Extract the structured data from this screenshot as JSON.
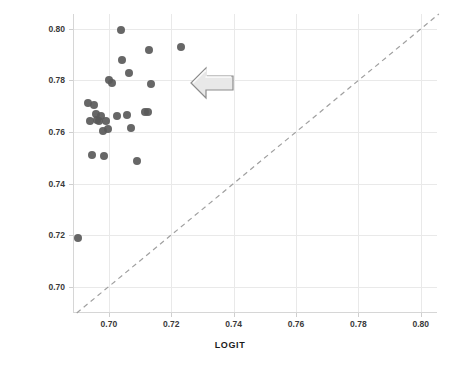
{
  "chart_data": {
    "type": "scatter",
    "title": "",
    "xlabel": "LOGIT",
    "ylabel": "NEURAL NETWORK",
    "xlim": [
      0.6885,
      0.8052
    ],
    "ylim": [
      0.6897,
      0.8058
    ],
    "xticks": [
      "0.70",
      "0.72",
      "0.74",
      "0.76",
      "0.78",
      "0.80"
    ],
    "xtick_values": [
      0.7,
      0.72,
      0.74,
      0.76,
      0.78,
      0.8
    ],
    "yticks": [
      "0.70",
      "0.72",
      "0.74",
      "0.76",
      "0.78",
      "0.80"
    ],
    "ytick_values": [
      0.7,
      0.72,
      0.74,
      0.76,
      0.78,
      0.8
    ],
    "grid": true,
    "legend": "none",
    "series": [
      {
        "name": "models",
        "marker": "circle",
        "color": "#5a5a5a",
        "points": [
          {
            "x": 0.6901,
            "y": 0.7187
          },
          {
            "x": 0.6932,
            "y": 0.7714
          },
          {
            "x": 0.6939,
            "y": 0.7641
          },
          {
            "x": 0.6946,
            "y": 0.7512
          },
          {
            "x": 0.6952,
            "y": 0.7706
          },
          {
            "x": 0.6958,
            "y": 0.7669
          },
          {
            "x": 0.6961,
            "y": 0.7645
          },
          {
            "x": 0.6968,
            "y": 0.7641
          },
          {
            "x": 0.6974,
            "y": 0.7661
          },
          {
            "x": 0.6981,
            "y": 0.7605
          },
          {
            "x": 0.6984,
            "y": 0.7508
          },
          {
            "x": 0.699,
            "y": 0.7641
          },
          {
            "x": 0.6997,
            "y": 0.7613
          },
          {
            "x": 0.7,
            "y": 0.78
          },
          {
            "x": 0.701,
            "y": 0.779
          },
          {
            "x": 0.7026,
            "y": 0.7661
          },
          {
            "x": 0.7039,
            "y": 0.7996
          },
          {
            "x": 0.7042,
            "y": 0.7879
          },
          {
            "x": 0.7058,
            "y": 0.7665
          },
          {
            "x": 0.7065,
            "y": 0.7827
          },
          {
            "x": 0.7071,
            "y": 0.7617
          },
          {
            "x": 0.709,
            "y": 0.7488
          },
          {
            "x": 0.7116,
            "y": 0.7677
          },
          {
            "x": 0.7126,
            "y": 0.7677
          },
          {
            "x": 0.7129,
            "y": 0.7919
          },
          {
            "x": 0.7135,
            "y": 0.7786
          },
          {
            "x": 0.7232,
            "y": 0.7931
          }
        ]
      }
    ],
    "reference_line": {
      "name": "identity-line",
      "style": "dashed",
      "color": "#a0a0a0",
      "from": {
        "x": 0.6897,
        "y": 0.6897
      },
      "to": {
        "x": 0.8058,
        "y": 0.8058
      }
    },
    "annotations": [
      {
        "name": "left-arrow-annotation",
        "shape": "left-arrow",
        "x": 0.7265,
        "y": 0.779,
        "fill": "#e8e8e8",
        "stroke": "#8c8c8c"
      }
    ]
  }
}
